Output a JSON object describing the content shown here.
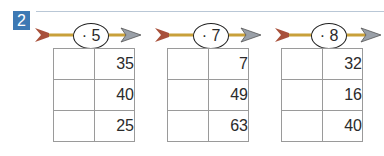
{
  "exercise_number": "2",
  "colors": {
    "badge": "#3d79b4",
    "rule_line": "#b9c7d6",
    "arrow_shaft": "#c8a03a",
    "arrow_fletch": "#a8503a",
    "arrow_head": "#9aa0a8"
  },
  "tables": [
    {
      "operator": "· 5",
      "rows": [
        {
          "input": "",
          "output": "35"
        },
        {
          "input": "",
          "output": "40"
        },
        {
          "input": "",
          "output": "25"
        }
      ]
    },
    {
      "operator": "· 7",
      "rows": [
        {
          "input": "",
          "output": "7"
        },
        {
          "input": "",
          "output": "49"
        },
        {
          "input": "",
          "output": "63"
        }
      ]
    },
    {
      "operator": "· 8",
      "rows": [
        {
          "input": "",
          "output": "32"
        },
        {
          "input": "",
          "output": "16"
        },
        {
          "input": "",
          "output": "40"
        }
      ]
    }
  ]
}
